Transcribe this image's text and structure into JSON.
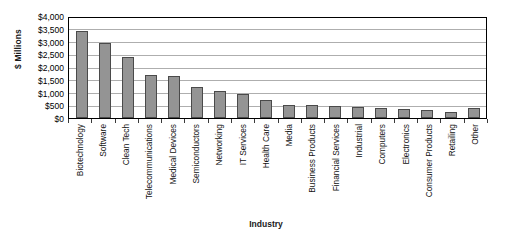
{
  "chart_data": {
    "type": "bar",
    "title": "",
    "xlabel": "Industry",
    "ylabel": "$ Millions",
    "ylim": [
      0,
      4000
    ],
    "ytick_step": 500,
    "grid": true,
    "legend": "none",
    "bar_color": "#949494",
    "bar_border_color": "#4a4a4a",
    "axis_color": "#000000",
    "gridline_color": "#aeaeae",
    "ytick_labels": [
      "$4,000",
      "$3,500",
      "$3,000",
      "$2,500",
      "$2,000",
      "$1,500",
      "$1,000",
      "$500",
      "$0"
    ],
    "ytick_values": [
      4000,
      3500,
      3000,
      2500,
      2000,
      1500,
      1000,
      500,
      0
    ],
    "categories": [
      "Biotechnology",
      "Software",
      "Clean Tech",
      "Telecommunications",
      "Medical Devices",
      "Semiconductors",
      "Networking",
      "IT Services",
      "Health Care",
      "Media",
      "Business Products",
      "Financial Services",
      "Industrial",
      "Computers",
      "Electronics",
      "Consumer Products",
      "Retailing",
      "Other"
    ],
    "values": [
      3400,
      2950,
      2400,
      1700,
      1650,
      1200,
      1050,
      950,
      700,
      520,
      500,
      470,
      420,
      400,
      370,
      330,
      250,
      400
    ]
  }
}
